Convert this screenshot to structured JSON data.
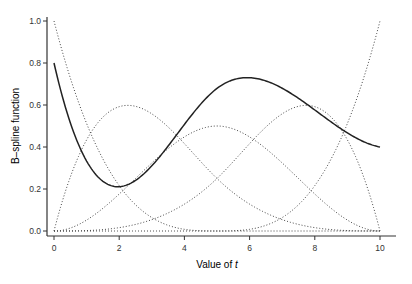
{
  "chart_data": {
    "type": "line",
    "title": "",
    "xlabel": "Value of",
    "xlabel_italic": "t",
    "ylabel": "B–spline function",
    "xlim": [
      0,
      10
    ],
    "ylim": [
      0,
      1.0
    ],
    "xticks": [
      0,
      2,
      4,
      6,
      8,
      10
    ],
    "xtick_labels": [
      "0",
      "2",
      "4",
      "6",
      "8",
      "10"
    ],
    "yticks": [
      0.0,
      0.2,
      0.4,
      0.6,
      0.8,
      1.0
    ],
    "ytick_labels": [
      "0.0",
      "0.2",
      "0.4",
      "0.6",
      "0.8",
      "1.0"
    ],
    "grid": false,
    "legend": null,
    "spline": {
      "degree": 3,
      "knots": [
        0,
        0,
        0,
        0,
        5,
        10,
        10,
        10,
        10
      ],
      "basis_count": 5
    },
    "series": [
      {
        "name": "B1",
        "style": "dotted",
        "color": "#444444",
        "x": [
          0,
          1,
          2,
          3,
          4,
          5,
          6,
          7,
          8,
          9,
          10
        ],
        "values": [
          1.0,
          0.512,
          0.216,
          0.064,
          0.008,
          0,
          0,
          0,
          0,
          0,
          0
        ]
      },
      {
        "name": "B2",
        "style": "dotted",
        "color": "#444444",
        "x": [
          0,
          1,
          2,
          3,
          4,
          5,
          6,
          7,
          8,
          9,
          10
        ],
        "values": [
          0,
          0.434,
          0.592,
          0.558,
          0.416,
          0.25,
          0.128,
          0.054,
          0.016,
          0.002,
          0
        ]
      },
      {
        "name": "B3",
        "style": "dotted",
        "color": "#444444",
        "x": [
          0,
          1,
          2,
          3,
          4,
          5,
          6,
          7,
          8,
          9,
          10
        ],
        "values": [
          0,
          0.052,
          0.176,
          0.324,
          0.448,
          0.5,
          0.448,
          0.324,
          0.176,
          0.052,
          0
        ]
      },
      {
        "name": "B4",
        "style": "dotted",
        "color": "#444444",
        "x": [
          0,
          1,
          2,
          3,
          4,
          5,
          6,
          7,
          8,
          9,
          10
        ],
        "values": [
          0,
          0.002,
          0.016,
          0.054,
          0.128,
          0.25,
          0.416,
          0.558,
          0.592,
          0.434,
          0
        ]
      },
      {
        "name": "B5",
        "style": "dotted",
        "color": "#444444",
        "x": [
          0,
          1,
          2,
          3,
          4,
          5,
          6,
          7,
          8,
          9,
          10
        ],
        "values": [
          0,
          0,
          0,
          0,
          0,
          0,
          0.008,
          0.064,
          0.216,
          0.512,
          1.0
        ]
      },
      {
        "name": "spline",
        "style": "solid",
        "color": "#222222",
        "coefficients": [
          0.8,
          -0.334,
          1.3,
          0.45,
          0.4
        ],
        "x": [
          0,
          1,
          2,
          3,
          4,
          5,
          6,
          7,
          8,
          9,
          10
        ],
        "values": [
          0.8,
          0.38,
          0.22,
          0.31,
          0.47,
          0.6,
          0.7,
          0.68,
          0.58,
          0.47,
          0.4
        ]
      }
    ]
  },
  "layout": {
    "plot_left_px": 54,
    "plot_right_px": 380,
    "plot_bottom_px": 231,
    "plot_top_px": 21
  }
}
